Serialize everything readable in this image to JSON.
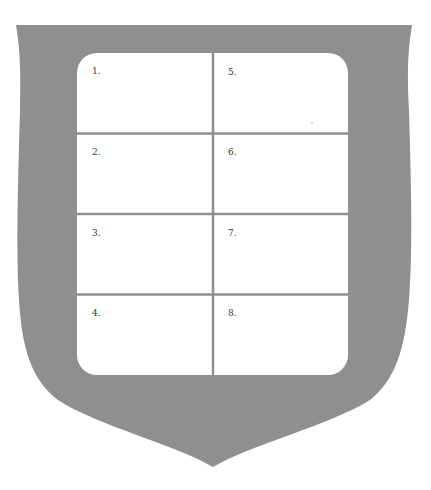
{
  "shield": {
    "fill_color": "#8f8f8f",
    "panel_color": "#ffffff",
    "divider_color": "#8f8f8f"
  },
  "grid": {
    "columns": 2,
    "rows": 4,
    "cells": [
      {
        "label": "1."
      },
      {
        "label": "2."
      },
      {
        "label": "3."
      },
      {
        "label": "4."
      },
      {
        "label": "5."
      },
      {
        "label": "6."
      },
      {
        "label": "7."
      },
      {
        "label": "8."
      }
    ]
  }
}
